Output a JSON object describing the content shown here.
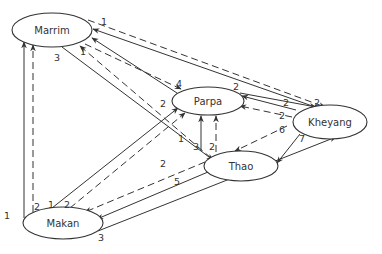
{
  "diagram": {
    "type": "directed-network",
    "line_color": "#333333",
    "legend": {
      "solid": "one relation type",
      "dashed": "another relation type"
    },
    "nodes": [
      {
        "id": "marrim",
        "label": "Marrim",
        "cx": 52,
        "cy": 30,
        "rx": 40,
        "ry": 17
      },
      {
        "id": "parpa",
        "label": "Parpa",
        "cx": 208,
        "cy": 101,
        "rx": 36,
        "ry": 14
      },
      {
        "id": "kheyang",
        "label": "Kheyang",
        "cx": 330,
        "cy": 122,
        "rx": 37,
        "ry": 17
      },
      {
        "id": "thao",
        "label": "Thao",
        "cx": 241,
        "cy": 166,
        "rx": 37,
        "ry": 15
      },
      {
        "id": "makan",
        "label": "Makan",
        "cx": 63,
        "cy": 223,
        "rx": 40,
        "ry": 16
      }
    ],
    "edge_labels": [
      {
        "text": "1",
        "x": 104,
        "y": 22
      },
      {
        "text": "3",
        "x": 57,
        "y": 58
      },
      {
        "text": "1",
        "x": 83,
        "y": 52
      },
      {
        "text": "4",
        "x": 179,
        "y": 84
      },
      {
        "text": "2",
        "x": 163,
        "y": 104
      },
      {
        "text": "2",
        "x": 236,
        "y": 87
      },
      {
        "text": "2",
        "x": 286,
        "y": 103
      },
      {
        "text": "2",
        "x": 317,
        "y": 103
      },
      {
        "text": "2",
        "x": 282,
        "y": 116
      },
      {
        "text": "6",
        "x": 282,
        "y": 130
      },
      {
        "text": "7",
        "x": 302,
        "y": 139
      },
      {
        "text": "1",
        "x": 181,
        "y": 139
      },
      {
        "text": "3",
        "x": 196,
        "y": 147
      },
      {
        "text": "2",
        "x": 212,
        "y": 147
      },
      {
        "text": "2",
        "x": 163,
        "y": 164
      },
      {
        "text": "5",
        "x": 177,
        "y": 182
      },
      {
        "text": "1",
        "x": 7,
        "y": 216
      },
      {
        "text": "2",
        "x": 37,
        "y": 207
      },
      {
        "text": "1",
        "x": 51,
        "y": 205
      },
      {
        "text": "2",
        "x": 67,
        "y": 205
      },
      {
        "text": "3",
        "x": 101,
        "y": 238
      }
    ]
  }
}
